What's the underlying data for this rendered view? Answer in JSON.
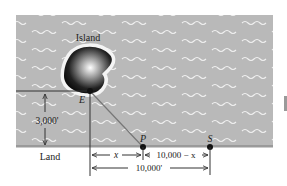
{
  "diagram": {
    "labels": {
      "island": "Island",
      "land": "Land",
      "point_e": "E",
      "point_p": "P",
      "point_s": "S",
      "height": "3,000'",
      "dist_x": "x",
      "dist_remaining": "10,000 − x",
      "dist_total": "10,000'"
    },
    "colors": {
      "water": "#b9b9b9",
      "wave": "#f2f2f2",
      "shore": "#9a9a9a",
      "island_dark": "#111111",
      "island_light": "#ffffff",
      "line": "#333333",
      "path_line": "#777777"
    },
    "points": {
      "E": [
        90,
        91
      ],
      "P": [
        143,
        147
      ],
      "S": [
        210,
        147
      ]
    },
    "dimensions": {
      "height_ft": 3000,
      "total_ft": 10000
    }
  }
}
